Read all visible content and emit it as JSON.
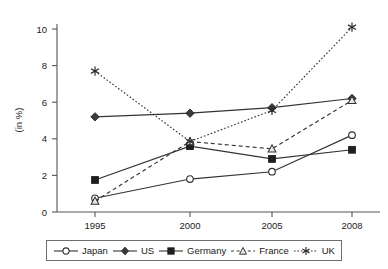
{
  "chart_data": {
    "type": "line",
    "title": "",
    "xlabel": "",
    "ylabel": "(in %)",
    "categories": [
      "1995",
      "2000",
      "2005",
      "2008"
    ],
    "ylim": [
      0,
      11
    ],
    "yticks": [
      0,
      2,
      4,
      6,
      8,
      10
    ],
    "ytick_labels": [
      "0",
      "2",
      "4",
      "6",
      "8",
      "10"
    ],
    "grid": false,
    "legend_position": "bottom",
    "series": [
      {
        "name": "Japan",
        "marker": "open-circle",
        "line_style": "solid",
        "color": "#333333",
        "values": [
          0.75,
          1.8,
          2.2,
          4.2
        ]
      },
      {
        "name": "US",
        "marker": "filled-diamond",
        "line_style": "solid",
        "color": "#333333",
        "values": [
          5.2,
          5.4,
          5.7,
          6.2
        ]
      },
      {
        "name": "Germany",
        "marker": "filled-square",
        "line_style": "solid",
        "color": "#333333",
        "values": [
          1.75,
          3.6,
          2.9,
          3.4
        ]
      },
      {
        "name": "France",
        "marker": "open-triangle",
        "line_style": "dashed",
        "color": "#333333",
        "values": [
          0.6,
          3.85,
          3.45,
          6.1
        ]
      },
      {
        "name": "UK",
        "marker": "asterisk",
        "line_style": "dotted",
        "color": "#333333",
        "values": [
          7.7,
          3.85,
          5.55,
          10.1
        ]
      }
    ]
  },
  "axis": {
    "ylabel": "(in %)",
    "ytick_labels": [
      "10",
      "8",
      "6",
      "4",
      "2",
      "0"
    ],
    "xtick_labels": [
      "1995",
      "2000",
      "2005",
      "2008"
    ]
  },
  "legend": {
    "items": [
      {
        "label": "Japan",
        "marker": "open-circle",
        "line_style": "solid"
      },
      {
        "label": "US",
        "marker": "filled-diamond",
        "line_style": "solid"
      },
      {
        "label": "Germany",
        "marker": "filled-square",
        "line_style": "solid"
      },
      {
        "label": "France",
        "marker": "open-triangle",
        "line_style": "dashed"
      },
      {
        "label": "UK",
        "marker": "asterisk",
        "line_style": "dotted"
      }
    ]
  }
}
